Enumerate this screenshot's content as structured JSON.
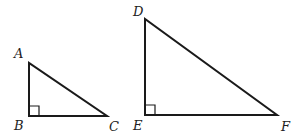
{
  "figure": {
    "triangles": [
      {
        "name": "ABC",
        "vertices": {
          "A": {
            "label": "A",
            "x": 29,
            "y": 63
          },
          "B": {
            "label": "B",
            "x": 29,
            "y": 116
          },
          "C": {
            "label": "C",
            "x": 107,
            "y": 116
          }
        },
        "right_angle_at": "B"
      },
      {
        "name": "DEF",
        "vertices": {
          "D": {
            "label": "D",
            "x": 145,
            "y": 19
          },
          "E": {
            "label": "E",
            "x": 145,
            "y": 115
          },
          "F": {
            "label": "F",
            "x": 277,
            "y": 115
          }
        },
        "right_angle_at": "E"
      }
    ]
  }
}
